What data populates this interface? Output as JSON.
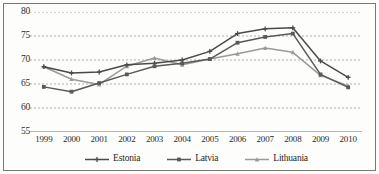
{
  "chart_data": {
    "type": "line",
    "title": "",
    "xlabel": "",
    "ylabel": "",
    "categories": [
      "1999",
      "2000",
      "2001",
      "2002",
      "2003",
      "2004",
      "2005",
      "2006",
      "2007",
      "2008",
      "2009",
      "2010"
    ],
    "ylim": [
      55,
      80
    ],
    "yticks": [
      55,
      60,
      65,
      70,
      75,
      80
    ],
    "grid": true,
    "legend_position": "bottom",
    "series": [
      {
        "name": "Estonia",
        "color": "#4a4a4a",
        "marker": "cross",
        "values": [
          68.6,
          67.3,
          67.5,
          69.0,
          69.3,
          70.0,
          71.8,
          75.5,
          76.5,
          76.7,
          69.8,
          66.4
        ]
      },
      {
        "name": "Latvia",
        "color": "#595959",
        "marker": "square",
        "values": [
          64.4,
          63.4,
          65.2,
          67.0,
          68.7,
          69.3,
          70.2,
          73.6,
          74.8,
          75.5,
          67.0,
          64.3
        ]
      },
      {
        "name": "Lithuania",
        "color": "#9a9a9a",
        "marker": "triangle",
        "values": [
          68.6,
          66.0,
          64.9,
          68.7,
          70.4,
          69.0,
          70.2,
          71.3,
          72.5,
          71.6,
          66.8,
          64.6
        ]
      }
    ]
  },
  "axis": {
    "ytick_labels": [
      "80",
      "75",
      "70",
      "65",
      "60",
      "55"
    ],
    "xtick_labels": [
      "1999",
      "2000",
      "2001",
      "2002",
      "2003",
      "2004",
      "2005",
      "2006",
      "2007",
      "2008",
      "2009",
      "2010"
    ]
  },
  "legend": {
    "items": [
      {
        "label": "Estonia"
      },
      {
        "label": "Latvia"
      },
      {
        "label": "Lithuania"
      }
    ]
  },
  "colors": {
    "grid": "#9b9b9b",
    "axis": "#6f6f6f",
    "estonia": "#4a4a4a",
    "latvia": "#595959",
    "lithuania": "#9a9a9a",
    "text": "#2b2b2b",
    "frame": "#7a7a72",
    "background": "#fdfdfb"
  }
}
